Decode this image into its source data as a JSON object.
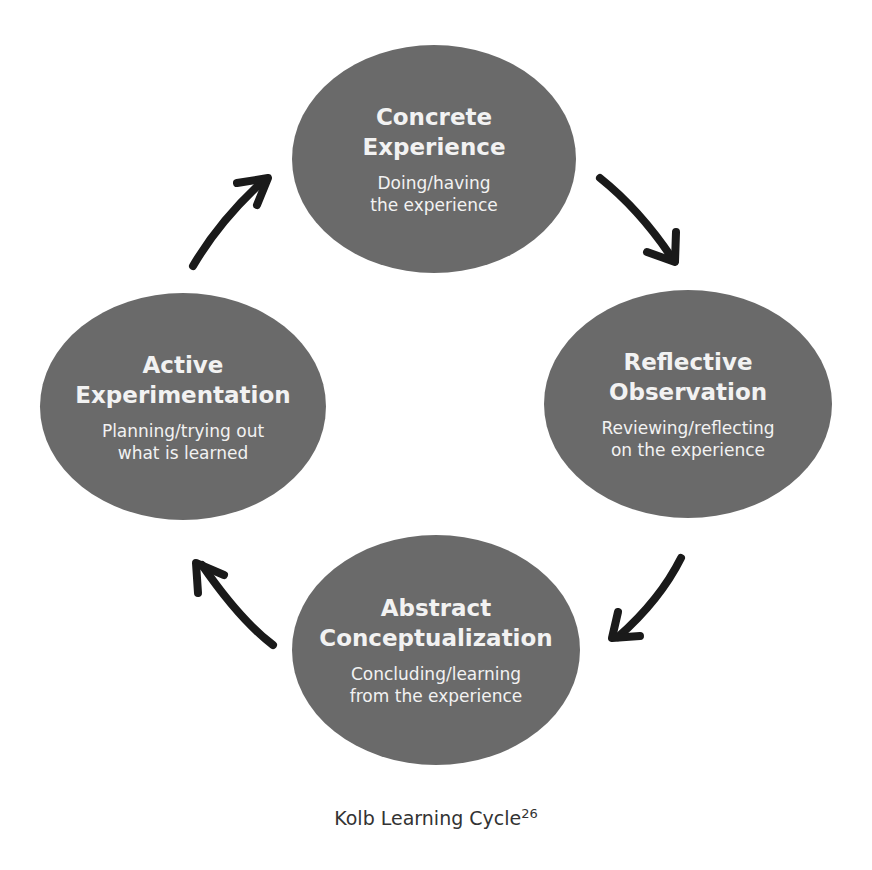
{
  "diagram": {
    "nodes": [
      {
        "id": "concrete-experience",
        "title_line1": "Concrete",
        "title_line2": "Experience",
        "desc_line1": "Doing/having",
        "desc_line2": "the experience"
      },
      {
        "id": "reflective-observation",
        "title_line1": "Reflective",
        "title_line2": "Observation",
        "desc_line1": "Reviewing/reflecting",
        "desc_line2": "on the experience"
      },
      {
        "id": "abstract-conceptualization",
        "title_line1": "Abstract",
        "title_line2": "Conceptualization",
        "desc_line1": "Concluding/learning",
        "desc_line2": "from the experience"
      },
      {
        "id": "active-experimentation",
        "title_line1": "Active",
        "title_line2": "Experimentation",
        "desc_line1": "Planning/trying out",
        "desc_line2": "what is learned"
      }
    ],
    "edges": [
      {
        "from": "concrete-experience",
        "to": "reflective-observation"
      },
      {
        "from": "reflective-observation",
        "to": "abstract-conceptualization"
      },
      {
        "from": "abstract-conceptualization",
        "to": "active-experimentation"
      },
      {
        "from": "active-experimentation",
        "to": "concrete-experience"
      }
    ],
    "colors": {
      "node_fill": "#6a6a6a",
      "node_text": "#f2f2f2",
      "arrow": "#1a1a1a",
      "caption": "#333333"
    }
  },
  "caption": {
    "text": "Kolb Learning Cycle",
    "superscript": "26"
  }
}
